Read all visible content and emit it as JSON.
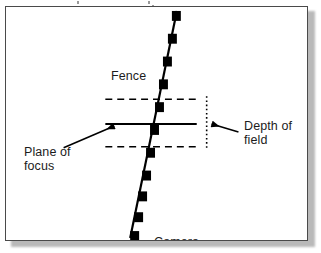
{
  "figure": {
    "background_color": "#ffffff",
    "frame_color": "#4a4a4a",
    "ink_color": "#000000",
    "text_color": "#1c1c1c",
    "shadow_color": "#b9b9b9"
  },
  "labels": {
    "fence": "Fence",
    "camera": "Camera",
    "depth_of_field_line1": "Depth of",
    "depth_of_field_line2": "field",
    "plane_of_focus_line1": "Plane of",
    "plane_of_focus_line2": "focus"
  },
  "diagram_data": {
    "type": "diagram",
    "description": "A receding fence (diagonal line with square posts) crosses a camera's plane of focus; dashed lines above and below mark the near and far limits of the depth of field.",
    "elements": [
      {
        "name": "fence-line",
        "kind": "line",
        "style": "solid",
        "stroke_width": 2,
        "color": "#000000",
        "from": [
          130,
          238
        ],
        "to": [
          176,
          10
        ]
      },
      {
        "name": "fence-posts",
        "kind": "squares",
        "color": "#000000",
        "count": 11,
        "size": 9,
        "positions": [
          [
            172,
            13
          ],
          [
            167,
            36
          ],
          [
            163,
            59
          ],
          [
            159,
            82
          ],
          [
            154,
            105
          ],
          [
            150,
            128
          ],
          [
            145,
            151
          ],
          [
            141,
            174
          ],
          [
            137,
            192
          ],
          [
            133,
            211
          ],
          [
            128,
            232
          ]
        ]
      },
      {
        "name": "plane-of-focus-line",
        "kind": "line",
        "style": "solid",
        "stroke_width": 2,
        "color": "#000000",
        "from": [
          104,
          124
        ],
        "to": [
          196,
          124
        ]
      },
      {
        "name": "far-limit-dashed-line",
        "kind": "line",
        "style": "dashed",
        "stroke_width": 1.6,
        "color": "#000000",
        "from": [
          104,
          99
        ],
        "to": [
          198,
          99
        ]
      },
      {
        "name": "near-limit-dashed-line",
        "kind": "line",
        "style": "dashed",
        "stroke_width": 1.6,
        "color": "#000000",
        "from": [
          104,
          147
        ],
        "to": [
          198,
          147
        ]
      },
      {
        "name": "depth-of-field-bracket",
        "kind": "line",
        "style": "dotted",
        "stroke_width": 1.6,
        "color": "#000000",
        "from": [
          206,
          96
        ],
        "to": [
          206,
          150
        ]
      },
      {
        "name": "depth-of-field-arrow",
        "kind": "arrow",
        "color": "#000000",
        "from": [
          236,
          131
        ],
        "to": [
          210,
          124
        ],
        "points_to": "depth-of-field-bracket"
      },
      {
        "name": "plane-of-focus-arrow",
        "kind": "arrow",
        "color": "#000000",
        "from": [
          66,
          147
        ],
        "to": [
          113,
          126
        ],
        "points_to": "plane-of-focus-line"
      }
    ]
  }
}
